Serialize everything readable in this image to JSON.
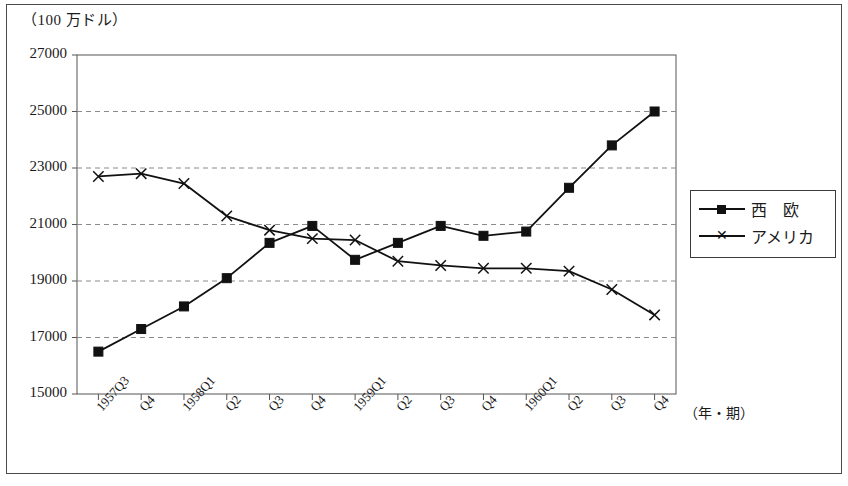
{
  "unit_label": "（100 万ドル）",
  "legend": {
    "items": [
      {
        "label": "西　欧",
        "marker": "square-marker"
      },
      {
        "label": "アメリカ",
        "marker": "x-marker"
      }
    ]
  },
  "axis": {
    "x_title": "（年・期）",
    "y_ticks": [
      "15000",
      "17000",
      "19000",
      "21000",
      "23000",
      "25000",
      "27000"
    ],
    "x_ticks": [
      "1957Q3",
      "Q4",
      "1958Q1",
      "Q2",
      "Q3",
      "Q4",
      "1959Q1",
      "Q2",
      "Q3",
      "Q4",
      "1960Q1",
      "Q2",
      "Q3",
      "Q4"
    ]
  },
  "caption": "",
  "chart_data": {
    "type": "line",
    "title": "",
    "xlabel": "（年・期）",
    "ylabel": "（100 万ドル）",
    "ylim": [
      15000,
      27000
    ],
    "ytick_step": 2000,
    "grid": true,
    "legend_position": "right-outside",
    "categories": [
      "1957Q3",
      "1957Q4",
      "1958Q1",
      "1958Q2",
      "1958Q3",
      "1958Q4",
      "1959Q1",
      "1959Q2",
      "1959Q3",
      "1959Q4",
      "1960Q1",
      "1960Q2",
      "1960Q3",
      "1960Q4"
    ],
    "series": [
      {
        "name": "西　欧",
        "marker": "square",
        "color": "#111111",
        "values": [
          16500,
          17300,
          18100,
          19100,
          20350,
          20950,
          19750,
          20350,
          20950,
          20600,
          20750,
          22300,
          23800,
          25000
        ]
      },
      {
        "name": "アメリカ",
        "marker": "x",
        "color": "#111111",
        "values": [
          22700,
          22800,
          22450,
          21300,
          20800,
          20500,
          20450,
          19700,
          19550,
          19450,
          19450,
          19350,
          18700,
          17800
        ]
      }
    ]
  }
}
